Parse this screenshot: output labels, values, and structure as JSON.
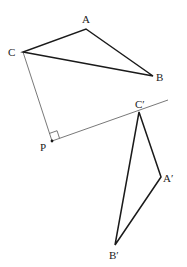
{
  "diagram": {
    "type": "geometric-rotation",
    "colors": {
      "stroke": "#1a1a1a",
      "construction": "#555555",
      "label": "#222222",
      "background": "#ffffff"
    },
    "points": {
      "A": {
        "label": "A",
        "x": 86,
        "y": 29
      },
      "B": {
        "label": "B",
        "x": 153,
        "y": 76
      },
      "C": {
        "label": "C",
        "x": 23,
        "y": 52
      },
      "P": {
        "label": "P",
        "x": 52,
        "y": 141
      },
      "A_prime": {
        "label": "A′",
        "x": 161,
        "y": 177
      },
      "B_prime": {
        "label": "B′",
        "x": 115,
        "y": 245
      },
      "C_prime": {
        "label": "C′",
        "x": 139,
        "y": 112
      }
    },
    "triangles": [
      {
        "name": "ABC",
        "vertices": [
          "A",
          "B",
          "C"
        ]
      },
      {
        "name": "A′B′C′",
        "vertices": [
          "A_prime",
          "B_prime",
          "C_prime"
        ]
      }
    ],
    "construction_lines": [
      {
        "from": "C",
        "to": "P"
      },
      {
        "from": "P",
        "through": "C_prime",
        "end": {
          "x": 168,
          "y": 100
        }
      }
    ],
    "right_angle_marker": {
      "at": "P",
      "size": 8
    }
  }
}
